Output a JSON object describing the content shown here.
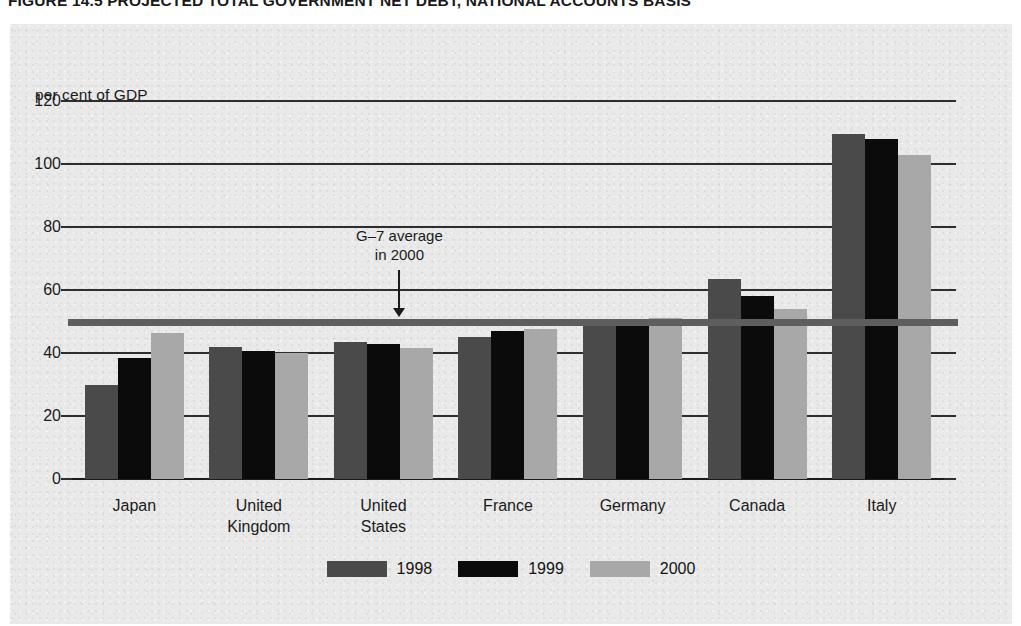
{
  "figure": {
    "title": "FIGURE 14.5   PROJECTED TOTAL GOVERNMENT NET DEBT, NATIONAL ACCOUNTS BASIS"
  },
  "annotation": {
    "line1": "G–7 average",
    "line2": "in 2000"
  },
  "legend": {
    "items": [
      {
        "label": "1998",
        "color": "#4a4a4a"
      },
      {
        "label": "1999",
        "color": "#0b0b0b"
      },
      {
        "label": "2000",
        "color": "#a8a8a8"
      }
    ]
  },
  "chart_data": {
    "type": "bar",
    "title": "FIGURE 14.5   PROJECTED TOTAL GOVERNMENT NET DEBT, NATIONAL ACCOUNTS BASIS",
    "xlabel": "",
    "ylabel": "per cent of GDP",
    "ylim": [
      0,
      120
    ],
    "yticks": [
      0,
      20,
      40,
      60,
      80,
      100,
      120
    ],
    "ytick_labels": [
      "0",
      "20",
      "40",
      "60",
      "80",
      "100",
      "120"
    ],
    "grid": true,
    "legend_position": "bottom-center",
    "categories": [
      "Japan",
      "United Kingdom",
      "United States",
      "France",
      "Germany",
      "Canada",
      "Italy"
    ],
    "category_lines": [
      [
        "Japan"
      ],
      [
        "United",
        "Kingdom"
      ],
      [
        "United",
        "States"
      ],
      [
        "France"
      ],
      [
        "Germany"
      ],
      [
        "Canada"
      ],
      [
        "Italy"
      ]
    ],
    "series": [
      {
        "name": "1998",
        "color": "#4a4a4a",
        "values": [
          30,
          42,
          43.5,
          45,
          48.5,
          63.5,
          109.5
        ]
      },
      {
        "name": "1999",
        "color": "#0b0b0b",
        "values": [
          38.5,
          40.5,
          43,
          47,
          49.5,
          58,
          108
        ]
      },
      {
        "name": "2000",
        "color": "#a8a8a8",
        "values": [
          46.5,
          40,
          41.5,
          47.5,
          51,
          54,
          103
        ]
      }
    ],
    "reference_line": {
      "label": "G–7 average in 2000",
      "value": 50,
      "color": "#5e5e5e"
    }
  }
}
